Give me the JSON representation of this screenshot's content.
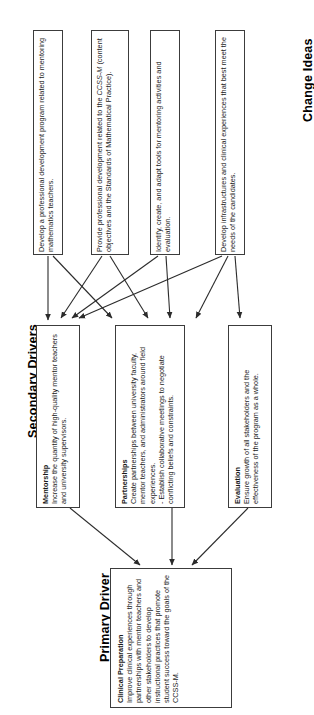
{
  "diagram": {
    "type": "driver-diagram",
    "orientation": "rotated-90-ccw",
    "sections": {
      "change_ideas": {
        "heading": "Change Ideas",
        "items": [
          {
            "text": "Develop a professional development program related to mentoring mathematics teachers."
          },
          {
            "text_part1": "Provide professional development related to the ",
            "text_italic": "CCSS-M",
            "text_part2": " (content objectives and the Standards of Mathematical Practice)."
          },
          {
            "text": "Identify, create, and adapt tools for mentoring activities and evaluation."
          },
          {
            "text": "Develop infrastructures and clinical experiences that best meet the needs of the candidates."
          }
        ]
      },
      "secondary_drivers": {
        "heading": "Secondary Drivers",
        "items": [
          {
            "title": "Mentorship",
            "body": "Increase the quantity of high-quality mentor teachers and university supervisors."
          },
          {
            "title": "Partnerships",
            "body": "Create partnerships between university faculty, mentor teachers, and administrators around field experiences.",
            "body2": "   - Establish collaborative meetings to negotiate conflicting beliefs and constraints."
          },
          {
            "title": "Evaluation",
            "body": "Ensure growth of all stakeholders and the effectiveness of the program as a whole."
          }
        ]
      },
      "primary_driver": {
        "heading": "Primary Driver",
        "items": [
          {
            "title": "Clinical Preparation",
            "body": "Improve clinical experiences through partnerships with mentor teachers and other stakeholders to develop instructional practices that promote student success toward the goals of the CCSS-M."
          }
        ]
      }
    },
    "colors": {
      "box_border": "#3c3c3c",
      "arrow": "#2b2b2b",
      "text": "#1a1a1a",
      "background": "#ffffff"
    }
  }
}
